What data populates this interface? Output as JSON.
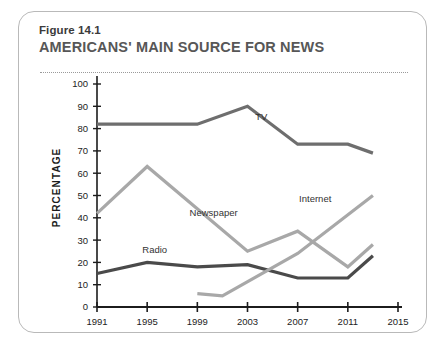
{
  "figure": {
    "number": "Figure 14.1",
    "title": "AMERICANS' MAIN SOURCE FOR NEWS"
  },
  "chart_data": {
    "type": "line",
    "title": "AMERICANS' MAIN SOURCE FOR NEWS",
    "xlabel": "",
    "ylabel": "PERCENTAGE",
    "xlim": [
      1991,
      2015
    ],
    "ylim": [
      0,
      100
    ],
    "xticks": [
      1991,
      1995,
      1999,
      2003,
      2007,
      2011,
      2015
    ],
    "yticks": [
      0,
      10,
      20,
      30,
      40,
      50,
      60,
      70,
      80,
      90,
      100
    ],
    "grid": false,
    "legend": "inline-labels",
    "series": [
      {
        "name": "TV",
        "color": "#6e6e6e",
        "label_x": 2004.1,
        "label_y": 84,
        "x": [
          1991,
          1995,
          1999,
          2003,
          2007,
          2011,
          2013
        ],
        "values": [
          82,
          82,
          82,
          90,
          73,
          73,
          69
        ]
      },
      {
        "name": "Newspaper",
        "color": "#a8a8a8",
        "label_x": 2000.3,
        "label_y": 41,
        "x": [
          1991,
          1995,
          2003,
          2007,
          2011,
          2013
        ],
        "values": [
          42,
          63,
          25,
          34,
          18,
          28
        ]
      },
      {
        "name": "Radio",
        "color": "#4a4a4a",
        "label_x": 1995.6,
        "label_y": 24,
        "x": [
          1991,
          1995,
          1999,
          2003,
          2007,
          2011,
          2013
        ],
        "values": [
          15,
          20,
          18,
          19,
          13,
          13,
          23
        ]
      },
      {
        "name": "Internet",
        "color": "#a8a8a8",
        "label_x": 2008.4,
        "label_y": 47,
        "x": [
          1999,
          2001,
          2007,
          2013
        ],
        "values": [
          6,
          5,
          24,
          50
        ]
      }
    ]
  }
}
